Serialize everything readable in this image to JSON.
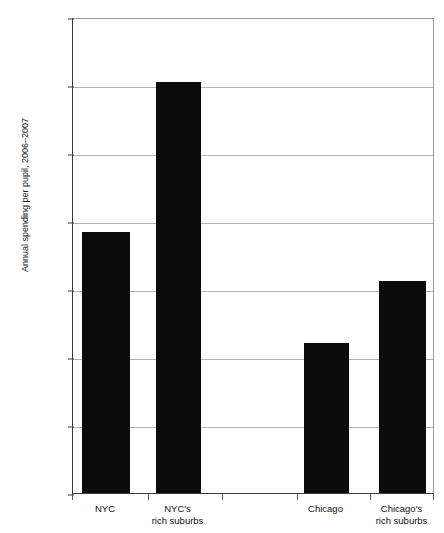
{
  "chart_data": {
    "type": "bar",
    "title": "",
    "xlabel": "",
    "ylabel": "Annual spending per pupil, 2006–2007",
    "categories": [
      "NYC",
      "NYC's rich suburbs",
      "Chicago",
      "Chicago's rich suburbs"
    ],
    "values": [
      19200,
      30200,
      11000,
      15600
    ],
    "ylim": [
      0,
      35000
    ],
    "ytick_values": [
      0,
      5000,
      10000,
      15000,
      20000,
      25000,
      30000,
      35000
    ],
    "ytick_labels": [
      "$0",
      "$5,000",
      "$10,000",
      "$15,000",
      "$20,000",
      "$25,000",
      "$30,000",
      "$35,000"
    ],
    "grid": true,
    "legend": false,
    "bar_color": "#0b0b0b",
    "series": [
      {
        "name": "Annual spending per pupil",
        "values": [
          19200,
          30200,
          11000,
          15600
        ]
      }
    ]
  },
  "axis": {
    "y_title": "Annual spending per pupil, 2006–2007",
    "ticks": [
      {
        "label": "$35,000",
        "value": 35000
      },
      {
        "label": "$30,000",
        "value": 30000
      },
      {
        "label": "$25,000",
        "value": 25000
      },
      {
        "label": "$20,000",
        "value": 20000
      },
      {
        "label": "$15,000",
        "value": 15000
      },
      {
        "label": "$10,000",
        "value": 10000
      },
      {
        "label": "$5,000",
        "value": 5000
      },
      {
        "label": "$0",
        "value": 0
      }
    ]
  },
  "x_categories": [
    {
      "line1": "NYC",
      "line2": ""
    },
    {
      "line1": "NYC's",
      "line2": "rich suburbs"
    },
    {
      "line1": "Chicago",
      "line2": ""
    },
    {
      "line1": "Chicago's",
      "line2": "rich suburbs"
    }
  ],
  "title_remnant": "",
  "colors": {
    "bar": "#0b0b0b",
    "grid": "#b4b4b4",
    "axis": "#3c3c3c",
    "frame": "#9a9a9a",
    "text": "#111111",
    "background": "#ffffff"
  }
}
